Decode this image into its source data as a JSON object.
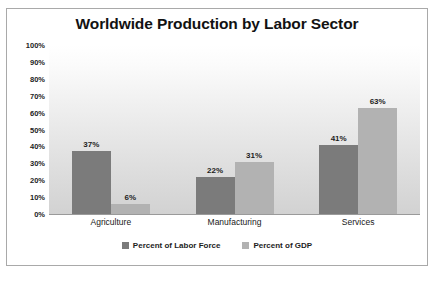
{
  "chart_data": {
    "type": "bar",
    "title": "Worldwide Production by Labor Sector",
    "xlabel": "",
    "ylabel": "",
    "ylim": [
      0,
      100
    ],
    "y_ticks": [
      "0%",
      "10%",
      "20%",
      "30%",
      "40%",
      "50%",
      "60%",
      "70%",
      "80%",
      "90%",
      "100%"
    ],
    "y_tick_values": [
      0,
      10,
      20,
      30,
      40,
      50,
      60,
      70,
      80,
      90,
      100
    ],
    "grid": false,
    "legend_position": "bottom",
    "categories": [
      "Agriculture",
      "Manufacturing",
      "Services"
    ],
    "series": [
      {
        "name": "Percent of Labor Force",
        "color": "#7b7b7b",
        "values": [
          37,
          22,
          41
        ],
        "labels": [
          "37%",
          "22%",
          "41%"
        ]
      },
      {
        "name": "Percent of GDP",
        "color": "#b2b2b2",
        "values": [
          6,
          31,
          63
        ],
        "labels": [
          "6%",
          "31%",
          "63%"
        ]
      }
    ]
  },
  "colors": {
    "series_labor_force": "#7b7b7b",
    "series_gdp": "#b2b2b2",
    "border": "#a9a9a9",
    "text": "#1d1d1d"
  }
}
